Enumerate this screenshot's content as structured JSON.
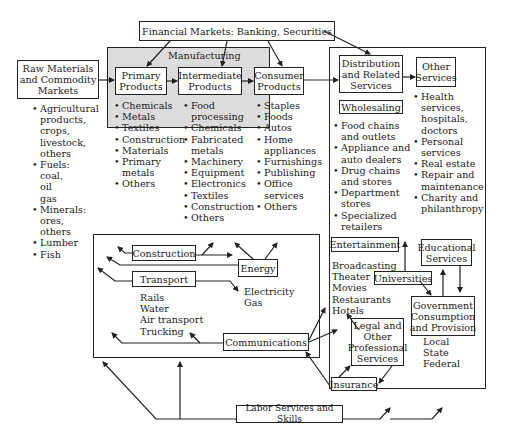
{
  "diagram": {
    "financial_markets": "Financial Markets: Banking, Securities",
    "raw_materials": {
      "title": "Raw Materials\nand Commodity\nMarkets",
      "items": [
        "Agricultural\nproducts,\ncrops,\nlivestock,\nothers",
        "Fuels:\ncoal,\noil\ngas",
        "Minerals:\nores,\nothers",
        "Lumber",
        "Fish"
      ]
    },
    "manufacturing": {
      "label": "Manufacturing",
      "primary": {
        "title": "Primary\nProducts",
        "items": [
          "Chemicals",
          "Metals",
          "Textiles",
          "Construction",
          "Materials",
          "Primary\nmetals",
          "Others"
        ]
      },
      "intermediate": {
        "title": "Intermediate\nProducts",
        "items": [
          "Food\nprocessing",
          "Chemicals",
          "Fabricated\nmetals",
          "Machinery",
          "Equipment",
          "Electronics",
          "Textiles",
          "Construction",
          "Others"
        ]
      },
      "consumer": {
        "title": "Consumer\nProducts",
        "items": [
          "Staples",
          "Foods",
          "Autos",
          "Home\nappliances",
          "Furnishings",
          "Publishing",
          "Office\nservices",
          "Others"
        ]
      }
    },
    "distribution": {
      "title": "Distribution\nand Related\nServices",
      "wholesaling": "Wholesaling",
      "items": [
        "Food chains\nand outlets",
        "Appliance and\nauto dealers",
        "Drug chains\nand stores",
        "Department\nstores",
        "Specialized\nretailers"
      ]
    },
    "other_services": {
      "title": "Other\nServices",
      "items": [
        "Health\nservices,\nhospitals,\ndoctors",
        "Personal\nservices",
        "Real estate",
        "Repair and\nmaintenance",
        "Charity and\nphilanthropy"
      ]
    },
    "infrastructure": {
      "construction": "Construction",
      "energy": "Energy",
      "energy_items": [
        "Electricity",
        "Gas"
      ],
      "transport": "Transport",
      "transport_items": [
        "Rails",
        "Water",
        "Air transport",
        "Trucking"
      ],
      "communications": "Communications"
    },
    "entertainment": {
      "title": "Entertainment",
      "items": [
        "Broadcasting",
        "Theater",
        "Movies",
        "Restaurants",
        "Hotels"
      ]
    },
    "educational": "Educational\nServices",
    "universities": "Universities",
    "government": {
      "title": "Government\nConsumption\nand Provision",
      "items": [
        "Local",
        "State",
        "Federal"
      ]
    },
    "legal": "Legal and\nOther\nProfessional\nServices",
    "insurance": "Insurance",
    "labor": "Labor Services and Skills"
  }
}
